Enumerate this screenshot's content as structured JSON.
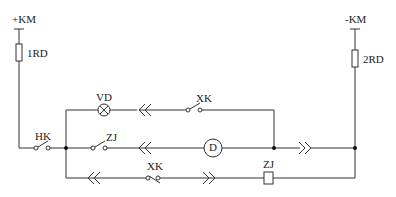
{
  "diagram": {
    "type": "electrical-circuit",
    "labels": {
      "pos_bus": "+KM",
      "neg_bus": "-KM",
      "fuse_left": "1RD",
      "fuse_right": "2RD",
      "lamp": "VD",
      "switch_top": "XK",
      "main_switch": "HK",
      "relay_contact": "ZJ",
      "motor": "D",
      "switch_bottom": "XK",
      "relay_coil": "ZJ"
    },
    "colors": {
      "line": "#333333",
      "background": "#ffffff"
    }
  }
}
